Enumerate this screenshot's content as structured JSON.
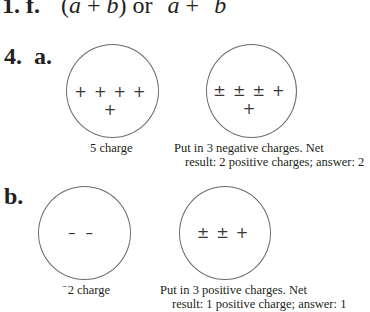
{
  "problem_1": {
    "number": "1.",
    "part": "f.",
    "expression": {
      "open": "(",
      "a": "a",
      "plus": "+",
      "b": "b",
      "close": ")",
      "or": "or",
      "neg_a": "a",
      "neg_b": "b",
      "minus_sign": "−"
    }
  },
  "problem_4": {
    "number": "4.",
    "a": {
      "label": "a.",
      "left_circle": {
        "charges": [
          "+",
          "+",
          "+",
          "+",
          "+"
        ],
        "caption": "5 charge"
      },
      "right_circle": {
        "charges": [
          "±",
          "±",
          "±",
          "+",
          "+"
        ],
        "caption_line1": "Put in 3 negative charges. Net",
        "caption_line2": "result: 2 positive charges; answer: 2"
      }
    },
    "b": {
      "label": "b.",
      "left_circle": {
        "charges": [
          "–",
          "–"
        ],
        "caption_sign": "−",
        "caption": "2 charge"
      },
      "right_circle": {
        "charges": [
          "±",
          "±",
          "+"
        ],
        "caption_line1": "Put in 3 positive charges. Net",
        "caption_line2": "result: 1 positive charge; answer: 1"
      }
    }
  }
}
